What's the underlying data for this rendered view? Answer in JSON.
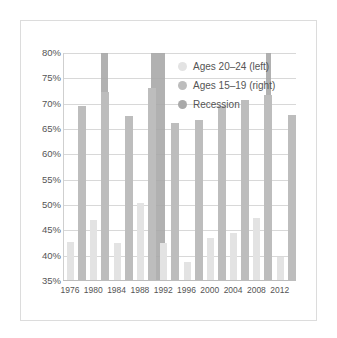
{
  "chart_data": {
    "type": "bar",
    "title": "",
    "xlabel": "",
    "ylabel": "",
    "ylim": [
      35,
      80
    ],
    "yticks": [
      "80%",
      "75%",
      "70%",
      "65%",
      "60%",
      "55%",
      "50%",
      "45%",
      "40%",
      "35%"
    ],
    "categories": [
      "1976",
      "1980",
      "1984",
      "1988",
      "1992",
      "1996",
      "2000",
      "2004",
      "2008",
      "2012"
    ],
    "series": [
      {
        "name": "Ages 20–24 (left)",
        "color": "#e3e3e3",
        "values": [
          42.7,
          47.0,
          42.5,
          50.4,
          42.6,
          38.8,
          43.4,
          44.5,
          47.5,
          39.7
        ]
      },
      {
        "name": "Ages 15–19 (right)",
        "color": "#bdbdbd",
        "values": [
          69.5,
          72.4,
          67.6,
          73.0,
          66.2,
          66.7,
          69.5,
          70.8,
          71.8,
          67.8
        ]
      }
    ],
    "recessions": [
      {
        "name": "Recession",
        "start_x": 101,
        "end_x": 108
      },
      {
        "name": "Recession",
        "start_x": 151,
        "end_x": 165
      },
      {
        "name": "Recession",
        "start_x": 266,
        "end_x": 271
      }
    ],
    "legend": {
      "position": "upper-right",
      "entries": [
        {
          "label": "Ages 20–24 (left)",
          "color": "#e3e3e3"
        },
        {
          "label": "Ages 15–19 (right)",
          "color": "#bdbdbd"
        },
        {
          "label": "Recession",
          "color": "#a9a9a9"
        }
      ]
    },
    "grid": true
  }
}
